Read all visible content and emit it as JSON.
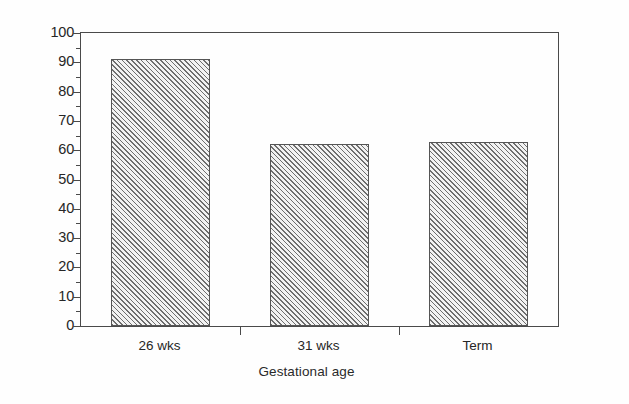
{
  "chart_data": {
    "type": "bar",
    "title": "",
    "subtitle": "",
    "xlabel": "Gestational age",
    "ylabel": "kcal kg⁻¹ day⁻¹",
    "ylabel_parts": {
      "base1": "kcal kg",
      "sup1": "-1",
      "base2": " day",
      "sup2": "-1"
    },
    "categories": [
      "26 wks",
      "31 wks",
      "Term"
    ],
    "values": [
      91,
      62,
      62.8
    ],
    "ylim": [
      0,
      100
    ],
    "xlim": [
      0,
      3
    ],
    "ytick_labels": [
      "0",
      "10",
      "20",
      "30",
      "40",
      "50",
      "60",
      "70",
      "80",
      "90",
      "100"
    ],
    "ytick_values": [
      0,
      10,
      20,
      30,
      40,
      50,
      60,
      70,
      80,
      90,
      100
    ],
    "yminor_values": [
      5,
      15,
      25,
      35,
      45,
      55,
      65,
      75,
      85,
      95
    ],
    "xtick_values": [
      0,
      1,
      2,
      3
    ],
    "grid": false,
    "legend": false,
    "legend_position": "none",
    "bar_width_fraction": 0.62,
    "colors": {
      "bar_fill": "#f2f2f2",
      "bar_hatch": "#6e6e6e",
      "bar_edge": "#555555",
      "axis": "#4a4a4a",
      "text": "#262626",
      "background": "#fefefe"
    },
    "annotations": []
  }
}
